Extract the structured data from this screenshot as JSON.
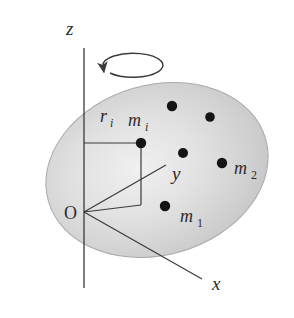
{
  "figure": {
    "kind": "physics-diagram",
    "canvas": {
      "width": 294,
      "height": 318
    },
    "background_color": "#ffffff",
    "line_color": "#3a3a3a",
    "label_color": "#2b2b2b",
    "dot_color": "#141414"
  },
  "body": {
    "name": "rigid-body-ellipse",
    "shape": "ellipse",
    "center_x": 157,
    "center_y": 170,
    "radius_x": 113,
    "radius_y": 85,
    "rotation_deg": -16,
    "fill_light": "#efefef",
    "fill_mid": "#d5d5d5",
    "fill_dark": "#b8b8b8",
    "edge_color": "#a8a8a8"
  },
  "axes": {
    "origin": {
      "label": "O",
      "x": 84,
      "y": 212
    },
    "z": {
      "label": "z",
      "label_x": 66,
      "label_y": 35,
      "x1": 84,
      "y1": 48,
      "x2": 84,
      "y2": 288
    },
    "y": {
      "label": "y",
      "label_x": 172,
      "label_y": 180,
      "x1": 84,
      "y1": 212,
      "x2": 166,
      "y2": 165
    },
    "x": {
      "label": "x",
      "label_x": 212,
      "label_y": 290,
      "x1": 84,
      "y1": 212,
      "x2": 202,
      "y2": 279
    }
  },
  "rotation_indicator": {
    "name": "rotation-arrow",
    "center_x": 84,
    "center_y": 78,
    "radius_x": 30,
    "radius_y": 12,
    "arrow_tip_x": 107,
    "arrow_tip_y": 65,
    "direction": "counterclockwise-about-z"
  },
  "construction": {
    "radius_label": "r",
    "radius_subscript": "i",
    "radius_label_x": 100,
    "radius_label_y": 122,
    "radius_line": {
      "x1": 84,
      "y1": 143,
      "x2": 141,
      "y2": 143
    },
    "drop_line": {
      "x1": 141,
      "y1": 143,
      "x2": 141,
      "y2": 205
    },
    "base_line": {
      "x1": 141,
      "y1": 205,
      "x2": 84,
      "y2": 212
    }
  },
  "masses": [
    {
      "id": "m-i",
      "label": "m",
      "subscript": "i",
      "subscript_style": "italic",
      "x": 141,
      "y": 143,
      "radius": 5.2,
      "label_x": 134,
      "label_y": 126,
      "labeled": true
    },
    {
      "id": "m-2",
      "label": "m",
      "subscript": "2",
      "subscript_style": "normal",
      "x": 222,
      "y": 163,
      "radius": 5.2,
      "label_x": 234,
      "label_y": 175,
      "labeled": true
    },
    {
      "id": "m-1",
      "label": "m",
      "subscript": "1",
      "subscript_style": "normal",
      "x": 165,
      "y": 206,
      "radius": 5.2,
      "label_x": 180,
      "label_y": 222,
      "labeled": true
    },
    {
      "id": "mass-dot-upper-left",
      "label": "",
      "subscript": "",
      "x": 172,
      "y": 106,
      "radius": 5.2,
      "labeled": false
    },
    {
      "id": "mass-dot-upper-right",
      "label": "",
      "subscript": "",
      "x": 210,
      "y": 117,
      "radius": 4.8,
      "labeled": false
    },
    {
      "id": "mass-dot-center",
      "label": "",
      "subscript": "",
      "x": 183,
      "y": 153,
      "radius": 5.0,
      "labeled": false
    }
  ]
}
